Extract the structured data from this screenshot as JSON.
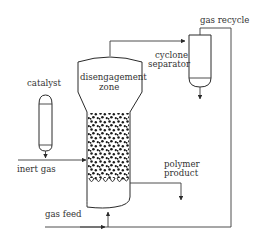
{
  "diagram": {
    "labels": {
      "catalyst": "catalyst",
      "inert_gas": "inert gas",
      "disengagement_zone_line1": "disengagement",
      "disengagement_zone_line2": "zone",
      "cyclone_line1": "cyclone",
      "cyclone_line2": "separator",
      "gas_recycle": "gas recycle",
      "polymer_line1": "polymer",
      "polymer_line2": "product",
      "gas_feed": "gas feed"
    },
    "colors": {
      "line": "#3a3a3a",
      "text": "#333333",
      "particles": "#1a1a1a",
      "background": "#ffffff"
    }
  }
}
